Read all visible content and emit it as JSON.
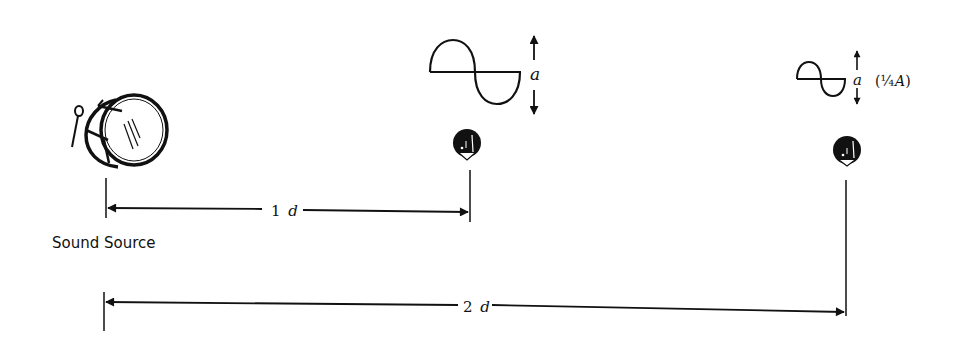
{
  "diagram": {
    "type": "physics-illustration",
    "topic": "Inverse square law of sound intensity",
    "colors": {
      "ink": "#111111",
      "background": "#ffffff"
    },
    "source": {
      "icon": "drum-icon",
      "label": "Sound Source"
    },
    "listeners": [
      {
        "id": "listener-1",
        "icon": "listener-head-icon",
        "distance_label_num": "1",
        "distance_label_unit": "d",
        "wave_amplitude_label": "a"
      },
      {
        "id": "listener-2",
        "icon": "listener-head-icon",
        "distance_label_num": "2",
        "distance_label_unit": "d",
        "wave_amplitude_label": "a",
        "wave_amplitude_note_open": "(",
        "wave_amplitude_note_frac": "¼",
        "wave_amplitude_note_var": "A",
        "wave_amplitude_note_close": ")"
      }
    ]
  }
}
